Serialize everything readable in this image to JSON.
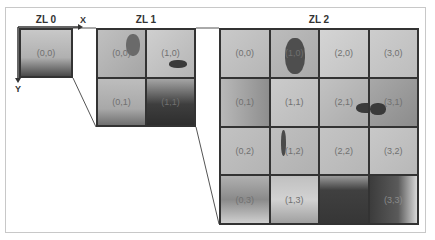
{
  "axes": {
    "x_label": "X",
    "y_label": "Y"
  },
  "levels": [
    {
      "label": "ZL 0",
      "cols": 1,
      "rows": 1,
      "tiles": [
        {
          "label": "(0,0)",
          "shade": "#a9a9a9"
        }
      ]
    },
    {
      "label": "ZL 1",
      "cols": 2,
      "rows": 2,
      "tiles": [
        {
          "label": "(0,0)",
          "shade": "#b3b3b3"
        },
        {
          "label": "(1,0)",
          "shade": "#c2c2c2"
        },
        {
          "label": "(0,1)",
          "shade": "#a8a8a8"
        },
        {
          "label": "(1,1)",
          "shade": "#6a6a6a"
        }
      ]
    },
    {
      "label": "ZL 2",
      "cols": 4,
      "rows": 4,
      "tiles": [
        {
          "label": "(0,0)",
          "shade": "#c4c4c4"
        },
        {
          "label": "(1,0)",
          "shade": "#9a9a9a"
        },
        {
          "label": "(2,0)",
          "shade": "#cfcfcf"
        },
        {
          "label": "(3,0)",
          "shade": "#c9c9c9"
        },
        {
          "label": "(0,1)",
          "shade": "#a6a6a6"
        },
        {
          "label": "(1,1)",
          "shade": "#c6c6c6"
        },
        {
          "label": "(2,1)",
          "shade": "#b8b8b8"
        },
        {
          "label": "(3,1)",
          "shade": "#a2a2a2"
        },
        {
          "label": "(0,2)",
          "shade": "#bdbdbd"
        },
        {
          "label": "(1,2)",
          "shade": "#b9b9b9"
        },
        {
          "label": "(2,2)",
          "shade": "#bebebe"
        },
        {
          "label": "(3,2)",
          "shade": "#c2c2c2"
        },
        {
          "label": "(0,3)",
          "shade": "#9c9c9c"
        },
        {
          "label": "(1,3)",
          "shade": "#b5b5b5"
        },
        {
          "label": "",
          "shade": "#555555"
        },
        {
          "label": "(3,3)",
          "shade": "#6e6e6e"
        }
      ]
    }
  ]
}
